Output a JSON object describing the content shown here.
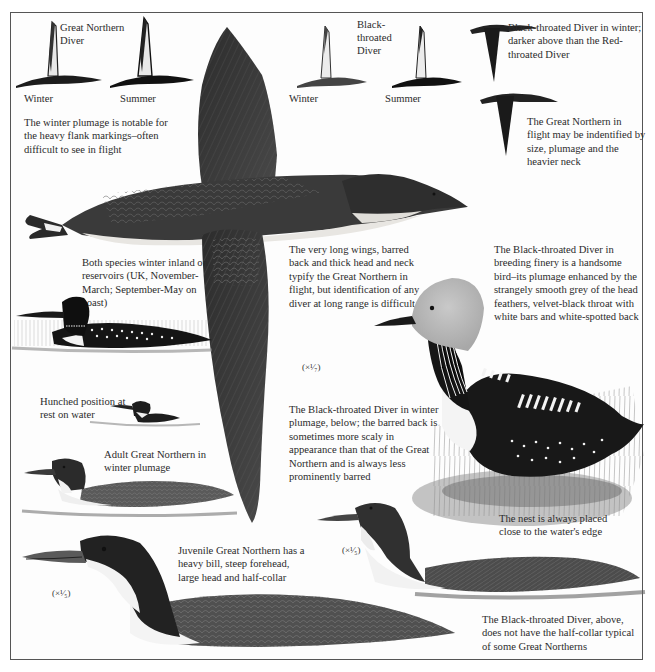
{
  "plate": {
    "flight_silhouettes": {
      "great_northern": {
        "title": "Great Northern Diver",
        "winter_label": "Winter",
        "summer_label": "Summer",
        "caption": "The winter plumage is notable for the heavy flank markings–often difficult to see in flight"
      },
      "black_throated": {
        "title": "Black-throated Diver",
        "winter_label": "Winter",
        "summer_label": "Summer"
      }
    },
    "captions": {
      "bt_winter_flight": "Black-throated Diver in winter; darker above than the Red-throated Diver",
      "gn_flight_id": "The Great Northern in flight may be indentified by size, plumage and the heavier neck",
      "long_wings": "The very long wings, barred back and thick head and neck typify the Great Northern in flight, but identification of any diver at long range is difficult",
      "bt_breeding": "The Black-throated Diver in breeding finery is a handsome bird–its plumage enhanced by the strangely smooth grey of the head feathers, velvet-black throat with white bars and white-spotted back",
      "winter_inland": "Both species winter inland on reservoirs (UK, November-March; September-May on coast)",
      "hunched": "Hunched position at rest on water",
      "bt_winter_plumage": "The Black-throated Diver in winter plumage, below; the barred back is sometimes more scaly in appearance than that of the Great Northern and is always less prominently barred",
      "adult_gn_winter": "Adult Great Northern in winter plumage",
      "nest": "The nest is always placed close to the water's edge",
      "juvenile_gn": "Juvenile Great Northern has a heavy bill, steep forehead, large head and half-collar",
      "bt_no_collar": "The Black-throated Diver, above, does not have the half-collar typical of some Great Northerns"
    },
    "scales": {
      "flight": "(×¹⁄₇)",
      "bt_swimming": "(×¹⁄₅)",
      "juvenile": "(×¹⁄₅)"
    }
  }
}
